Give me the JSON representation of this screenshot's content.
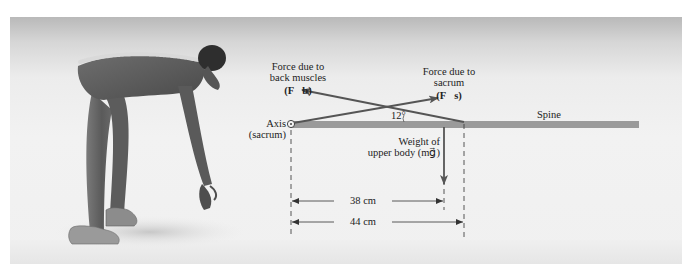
{
  "figure": {
    "colors": {
      "spine_bar": "#9a9a9a",
      "arrows": "#555555",
      "text": "#222222",
      "background_top": "#b9b9b9",
      "background_bottom": "#f0f0f0"
    }
  },
  "labels": {
    "force_back_muscles_line1": "Force due to",
    "force_back_muscles_line2": "back muscles",
    "force_back_muscles_symbol": "(F⃗b)",
    "force_sacrum_line1": "Force due to",
    "force_sacrum_line2": "sacrum",
    "force_sacrum_symbol": "(F⃗s)",
    "axis_line1": "Axis",
    "axis_line2": "(sacrum)",
    "angle": "12°",
    "spine": "Spine",
    "weight_line1": "Weight of",
    "weight_line2": "upper body (mg⃗)"
  },
  "dimensions": [
    {
      "label": "38 cm",
      "from": "axis",
      "to": "weight"
    },
    {
      "label": "44 cm",
      "from": "axis",
      "to": "muscle attachment"
    }
  ],
  "icons": {
    "axis": "pivot-circle-icon",
    "figure": "bending-person-illustration"
  }
}
